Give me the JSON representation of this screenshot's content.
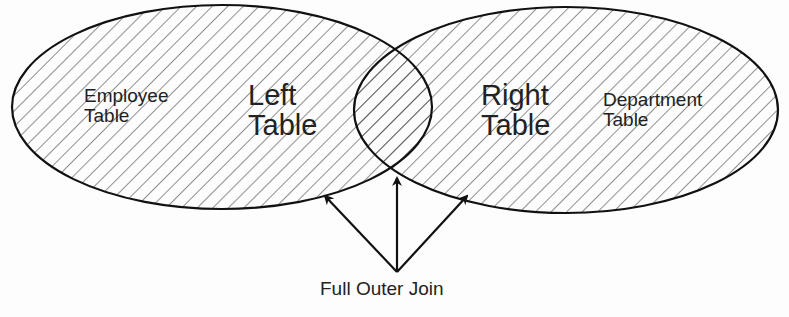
{
  "diagram": {
    "type": "venn",
    "left_set": {
      "title_line1": "Left",
      "title_line2": "Table",
      "sub_line1": "Employee",
      "sub_line2": "Table"
    },
    "right_set": {
      "title_line1": "Right",
      "title_line2": "Table",
      "sub_line1": "Department",
      "sub_line2": "Table"
    },
    "caption": "Full Outer Join",
    "colors": {
      "stroke": "#111111",
      "hatch": "#333333",
      "background": "#fdfdfd"
    }
  }
}
